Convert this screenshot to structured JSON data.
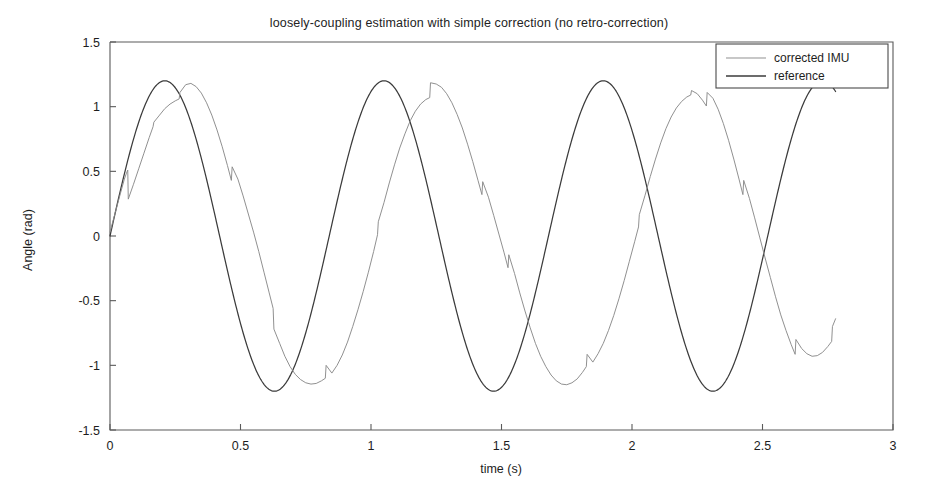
{
  "chart_data": {
    "type": "line",
    "title": "loosely-coupling estimation with simple correction (no retro-correction)",
    "xlabel": "time (s)",
    "ylabel": "Angle (rad)",
    "xlim": [
      0,
      3
    ],
    "ylim": [
      -1.5,
      1.5
    ],
    "xticks": [
      0,
      0.5,
      1,
      1.5,
      2,
      2.5,
      3
    ],
    "xtick_labels": [
      "0",
      "0.5",
      "1",
      "1.5",
      "2",
      "2.5",
      "3"
    ],
    "yticks": [
      -1.5,
      -1,
      -0.5,
      0,
      0.5,
      1,
      1.5
    ],
    "ytick_labels": [
      "-1.5",
      "-1",
      "-0.5",
      "0",
      "0.5",
      "1",
      "1.5"
    ],
    "grid": false,
    "legend_position": "top-right",
    "series": [
      {
        "name": "corrected IMU",
        "color": "#8a8a8a",
        "linewidth": 0.95,
        "x": [
          0.0,
          0.02,
          0.04,
          0.055,
          0.062,
          0.068,
          0.07,
          0.09,
          0.11,
          0.13,
          0.15,
          0.165,
          0.168,
          0.19,
          0.21,
          0.23,
          0.25,
          0.265,
          0.268,
          0.29,
          0.31,
          0.33,
          0.35,
          0.37,
          0.39,
          0.41,
          0.43,
          0.45,
          0.465,
          0.468,
          0.49,
          0.51,
          0.53,
          0.55,
          0.57,
          0.59,
          0.61,
          0.625,
          0.628,
          0.65,
          0.67,
          0.69,
          0.71,
          0.73,
          0.75,
          0.77,
          0.79,
          0.81,
          0.825,
          0.828,
          0.85,
          0.87,
          0.89,
          0.91,
          0.93,
          0.95,
          0.97,
          0.99,
          1.01,
          1.025,
          1.028,
          1.05,
          1.07,
          1.09,
          1.11,
          1.13,
          1.15,
          1.17,
          1.19,
          1.21,
          1.225,
          1.228,
          1.25,
          1.27,
          1.29,
          1.31,
          1.33,
          1.35,
          1.37,
          1.39,
          1.41,
          1.425,
          1.428,
          1.45,
          1.47,
          1.49,
          1.51,
          1.525,
          1.528,
          1.55,
          1.57,
          1.59,
          1.61,
          1.63,
          1.65,
          1.67,
          1.69,
          1.71,
          1.73,
          1.75,
          1.77,
          1.79,
          1.81,
          1.825,
          1.828,
          1.85,
          1.87,
          1.89,
          1.91,
          1.93,
          1.95,
          1.97,
          1.99,
          2.01,
          2.025,
          2.028,
          2.05,
          2.07,
          2.09,
          2.11,
          2.13,
          2.15,
          2.17,
          2.19,
          2.21,
          2.225,
          2.228,
          2.25,
          2.27,
          2.285,
          2.288,
          2.31,
          2.33,
          2.35,
          2.37,
          2.39,
          2.41,
          2.425,
          2.428,
          2.45,
          2.47,
          2.49,
          2.51,
          2.53,
          2.55,
          2.57,
          2.59,
          2.61,
          2.625,
          2.628,
          2.65,
          2.67,
          2.69,
          2.71,
          2.73,
          2.75,
          2.765,
          2.768,
          2.78
        ],
        "y": [
          0.03,
          0.18,
          0.33,
          0.44,
          0.48,
          0.51,
          0.285,
          0.4,
          0.52,
          0.64,
          0.76,
          0.845,
          0.88,
          0.935,
          0.985,
          1.02,
          1.045,
          1.06,
          1.11,
          1.17,
          1.18,
          1.155,
          1.105,
          1.03,
          0.935,
          0.82,
          0.69,
          0.545,
          0.43,
          0.535,
          0.44,
          0.31,
          0.17,
          0.03,
          -0.12,
          -0.28,
          -0.44,
          -0.56,
          -0.72,
          -0.83,
          -0.93,
          -1.01,
          -1.07,
          -1.11,
          -1.135,
          -1.145,
          -1.14,
          -1.12,
          -1.1,
          -1.0,
          -1.06,
          -1.0,
          -0.92,
          -0.82,
          -0.7,
          -0.57,
          -0.43,
          -0.28,
          -0.12,
          0.01,
          0.11,
          0.26,
          0.41,
          0.55,
          0.68,
          0.79,
          0.89,
          0.965,
          1.02,
          1.055,
          1.07,
          1.185,
          1.175,
          1.15,
          1.1,
          1.03,
          0.94,
          0.835,
          0.71,
          0.575,
          0.43,
          0.32,
          0.42,
          0.3,
          0.16,
          0.015,
          -0.13,
          -0.245,
          -0.145,
          -0.29,
          -0.44,
          -0.58,
          -0.71,
          -0.83,
          -0.93,
          -1.01,
          -1.075,
          -1.12,
          -1.145,
          -1.15,
          -1.135,
          -1.105,
          -1.055,
          -1.01,
          -0.915,
          -0.975,
          -0.91,
          -0.83,
          -0.73,
          -0.615,
          -0.485,
          -0.345,
          -0.195,
          -0.045,
          0.07,
          0.165,
          0.315,
          0.46,
          0.595,
          0.72,
          0.83,
          0.92,
          0.99,
          1.04,
          1.075,
          1.09,
          1.125,
          1.1,
          1.05,
          1.005,
          1.11,
          1.065,
          0.98,
          0.87,
          0.74,
          0.595,
          0.44,
          0.32,
          0.43,
          0.29,
          0.14,
          -0.015,
          -0.17,
          -0.32,
          -0.47,
          -0.61,
          -0.73,
          -0.84,
          -0.915,
          -0.8,
          -0.87,
          -0.91,
          -0.93,
          -0.925,
          -0.9,
          -0.855,
          -0.815,
          -0.7,
          -0.64
        ]
      },
      {
        "name": "reference",
        "color": "#3b3b3b",
        "linewidth": 1.25,
        "amplitude": 1.2,
        "period": 0.84,
        "phase_offset": 0.0,
        "x_start": 0.0,
        "x_end": 2.78,
        "description": "smooth sinusoid, amplitude 1.2 rad, period about 0.84 s, starting near zero and rising"
      }
    ],
    "annotations": []
  },
  "legend": {
    "entries": [
      {
        "label": "corrected IMU",
        "style": "thin-gray-line"
      },
      {
        "label": "reference",
        "style": "thick-dark-line"
      }
    ]
  }
}
